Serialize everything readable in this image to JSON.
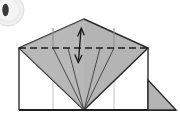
{
  "diagram": {
    "canvas": {
      "width": 180,
      "height": 124,
      "background": "#ffffff"
    }
  },
  "step_badge": {
    "visible": true,
    "label": "",
    "cut_off": true,
    "center_x": 8,
    "center_y": 10,
    "radius": 16,
    "fill": "#efefef",
    "ring": "#d8d8d8",
    "dot_fill": "#3a3a3a"
  },
  "colors": {
    "paper_front": "#b4b4b4",
    "paper_front_light": "#bcbcbc",
    "paper_back": "#ffffff",
    "outline": "#2b2b2b",
    "crease_soft": "#9a9a9a",
    "crease_faint": "#c2c2c2",
    "dash_line": "#1e1e1e",
    "arrow": "#141414",
    "shadow": "#8f8f8f"
  },
  "geometry": {
    "body_rect": {
      "left": 19,
      "top": 48,
      "right": 148,
      "bottom": 110
    },
    "kite": {
      "apex_top": [
        84,
        19
      ],
      "vertex_left": [
        19,
        48
      ],
      "vertex_right": [
        148,
        48
      ],
      "vertex_bottom": [
        84,
        110
      ]
    },
    "vertical_creases_x": [
      53,
      114
    ],
    "converging_lines_from": [
      [
        53,
        48
      ],
      [
        68,
        48
      ],
      [
        100,
        48
      ],
      [
        114,
        48
      ]
    ],
    "converging_lines_to": [
      84,
      110
    ],
    "right_flap_triangle": [
      [
        148,
        80
      ],
      [
        148,
        110
      ],
      [
        176,
        110
      ]
    ]
  },
  "dashed_fold_line": {
    "name": "valley-fold-line",
    "from_x": 19,
    "to_x": 148,
    "y": 48,
    "dash_pattern": "7 4",
    "stroke_width": 1.4
  },
  "fold_arrow": {
    "name": "double-headed-fold-arrow",
    "orientation": "vertical",
    "top_x": 81,
    "top_y": 28,
    "bottom_x": 78,
    "bottom_y": 62,
    "heads": "both",
    "meaning": "fold up and down / bring edge to line"
  },
  "legend": {
    "dashed_line_meaning": "valley fold line",
    "arrow_meaning": "fold direction",
    "gray_face_meaning": "colored side of paper",
    "white_face_meaning": "white side of paper"
  }
}
